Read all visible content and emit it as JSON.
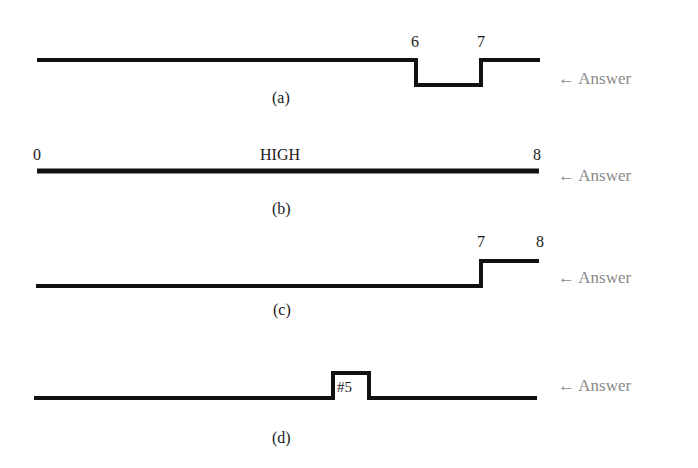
{
  "answer_label": "Answer",
  "arrow_glyph": "←",
  "waveforms": [
    {
      "id": "a",
      "caption": "(a)",
      "labels": [
        "6",
        "7"
      ],
      "description": "HIGH, goes LOW between 6 and 7, then HIGH"
    },
    {
      "id": "b",
      "caption": "(b)",
      "labels": [
        "0",
        "HIGH",
        "8"
      ],
      "description": "HIGH from 0 to 8"
    },
    {
      "id": "c",
      "caption": "(c)",
      "labels": [
        "7",
        "8"
      ],
      "description": "LOW until 7, then HIGH until 8"
    },
    {
      "id": "d",
      "caption": "(d)",
      "labels": [
        "#5"
      ],
      "description": "LOW with single pulse at #5"
    }
  ]
}
